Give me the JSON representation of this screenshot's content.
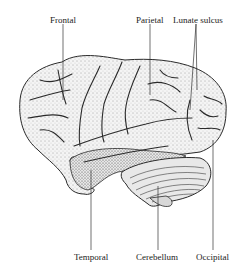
{
  "figure": {
    "labels": {
      "frontal": "Frontal",
      "parietal": "Parietal",
      "lunate_sulcus": "Lunate sulcus",
      "temporal": "Temporal",
      "cerebellum": "Cerebellum",
      "occipital": "Occipital"
    },
    "colors": {
      "ink": "#2a2a2a",
      "background": "#ffffff",
      "shade": "#d8d8d8"
    }
  }
}
